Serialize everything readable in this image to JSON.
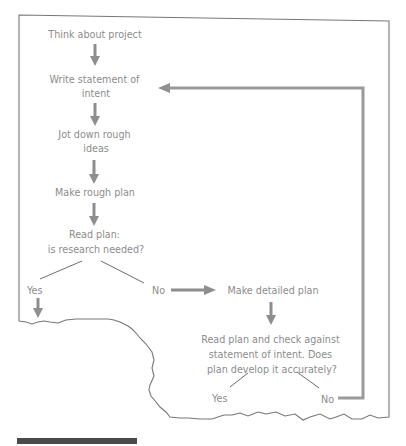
{
  "diagram": {
    "type": "flowchart",
    "nodes": {
      "think": [
        "Think about project"
      ],
      "write": [
        "Write statement of",
        "intent"
      ],
      "jot": [
        "Jot down rough",
        "ideas"
      ],
      "rough_plan": [
        "Make rough plan"
      ],
      "read_plan": [
        "Read plan:",
        "is research needed?"
      ],
      "detailed_plan": [
        "Make detailed plan"
      ],
      "check": [
        "Read plan and check against",
        "statement of intent. Does",
        "plan develop it accurately?"
      ]
    },
    "branches": {
      "research_yes": "Yes",
      "research_no": "No",
      "check_yes": "Yes",
      "check_no": "No"
    },
    "edges": [
      {
        "from": "think",
        "to": "write"
      },
      {
        "from": "write",
        "to": "jot"
      },
      {
        "from": "jot",
        "to": "rough_plan"
      },
      {
        "from": "rough_plan",
        "to": "read_plan"
      },
      {
        "from": "read_plan",
        "to": "research_yes"
      },
      {
        "from": "read_plan",
        "to": "research_no"
      },
      {
        "from": "research_no",
        "to": "detailed_plan"
      },
      {
        "from": "detailed_plan",
        "to": "check"
      },
      {
        "from": "check",
        "to": "check_yes"
      },
      {
        "from": "check",
        "to": "check_no"
      },
      {
        "from": "check_no",
        "to": "write",
        "label": "feedback loop"
      }
    ],
    "colors": {
      "text": "#8c8c8c",
      "arrow": "#8e8e8e",
      "frame": "#777777",
      "bar": "#4a4a4a"
    }
  }
}
